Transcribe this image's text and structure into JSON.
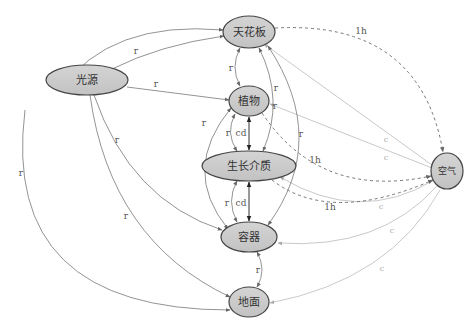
{
  "diagram": {
    "type": "directed-graph",
    "nodes": {
      "ceiling": "天花板",
      "light": "光源",
      "plant": "植物",
      "medium": "生长介质",
      "container": "容器",
      "ground": "地面",
      "air": "空气"
    },
    "edge_labels": {
      "radiation": "r",
      "convection": "c",
      "conduction": "cd",
      "humidity": "1h"
    },
    "edges": [
      {
        "from": "光源",
        "to": "天花板",
        "label": "r"
      },
      {
        "from": "光源",
        "to": "天花板",
        "label": "r"
      },
      {
        "from": "光源",
        "to": "植物",
        "label": "r"
      },
      {
        "from": "光源",
        "to": "容器",
        "label": "r"
      },
      {
        "from": "光源",
        "to": "地面",
        "label": "r"
      },
      {
        "from": "光源",
        "to": "地面",
        "label": "r"
      },
      {
        "from": "天花板",
        "to": "植物",
        "label": "r",
        "bidirectional": true
      },
      {
        "from": "天花板",
        "to": "生长介质",
        "label": "r"
      },
      {
        "from": "天花板",
        "to": "容器",
        "label": "r"
      },
      {
        "from": "天花板",
        "to": "空气",
        "label": "1h",
        "style": "dashed"
      },
      {
        "from": "植物",
        "to": "生长介质",
        "label": "cd",
        "bidirectional": true
      },
      {
        "from": "植物",
        "to": "生长介质",
        "label": "r",
        "bidirectional": true
      },
      {
        "from": "植物",
        "to": "容器",
        "label": "r",
        "bidirectional": true
      },
      {
        "from": "植物",
        "to": "空气",
        "label": "1h",
        "style": "dashed"
      },
      {
        "from": "生长介质",
        "to": "容器",
        "label": "cd",
        "bidirectional": true
      },
      {
        "from": "生长介质",
        "to": "容器",
        "label": "r",
        "bidirectional": true
      },
      {
        "from": "生长介质",
        "to": "空气",
        "label": "1h",
        "style": "dashed"
      },
      {
        "from": "容器",
        "to": "地面",
        "label": "r",
        "bidirectional": true
      },
      {
        "from": "空气",
        "to": "天花板",
        "label": "c"
      },
      {
        "from": "空气",
        "to": "植物",
        "label": "c"
      },
      {
        "from": "空气",
        "to": "生长介质",
        "label": "c"
      },
      {
        "from": "空气",
        "to": "容器",
        "label": "c"
      },
      {
        "from": "空气",
        "to": "地面",
        "label": "c"
      }
    ]
  }
}
